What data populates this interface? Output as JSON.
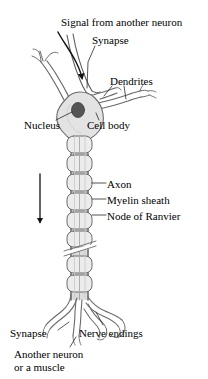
{
  "figure": {
    "type": "biological-diagram",
    "subject": "neuron"
  },
  "colors": {
    "background": "#ffffff",
    "outline": "#4a4a4a",
    "soma_fill": "#e3e3e3",
    "nucleus_fill": "#555555",
    "myelin_fill": "#ececec",
    "axon_fill": "#dcdcdc",
    "text": "#000000"
  },
  "labels": {
    "signal": "Signal from another neuron",
    "synapse_top": "Synapse",
    "dendrites": "Dendrites",
    "nucleus": "Nucleus",
    "cell_body": "Cell body",
    "axon": "Axon",
    "myelin_sheath": "Myelin sheath",
    "node_of_ranvier": "Node of Ranvier",
    "synapse_bottom": "Synapse",
    "nerve_endings": "Nerve endings",
    "another_neuron_line1": "Another neuron",
    "another_neuron_line2": "or a muscle"
  },
  "parts": [
    {
      "name": "signal-arrow",
      "description": "curved arrow entering from upper area pointing down to synapse"
    },
    {
      "name": "incoming-axon-terminal",
      "description": "axon of another neuron arriving at dendrite"
    },
    {
      "name": "dendrite-left",
      "description": "branched dendrite extending up-left from soma"
    },
    {
      "name": "dendrite-right",
      "description": "branched dendrite extending right from soma"
    },
    {
      "name": "cell-body",
      "description": "soma, shaded polygonal body"
    },
    {
      "name": "nucleus",
      "description": "dark oval inside the soma"
    },
    {
      "name": "axon",
      "description": "long vertical process descending from soma"
    },
    {
      "name": "myelin-sheath",
      "description": "segmented rounded sleeves along the axon"
    },
    {
      "name": "node-of-ranvier",
      "description": "gaps between myelin segments"
    },
    {
      "name": "conduction-arrow",
      "description": "vertical downward arrow showing impulse direction"
    },
    {
      "name": "axon-break",
      "description": "diagonal double slash indicating axon continues"
    },
    {
      "name": "nerve-endings",
      "description": "terminal branches at the axon end"
    },
    {
      "name": "terminal-synapse",
      "description": "synapse with another neuron or a muscle"
    }
  ]
}
